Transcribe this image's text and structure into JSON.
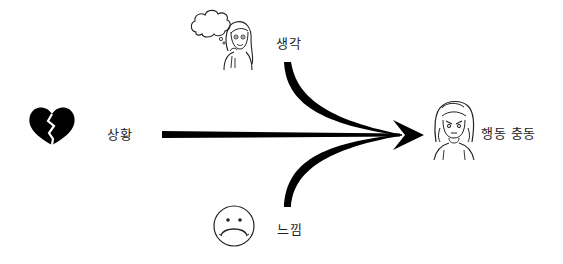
{
  "diagram": {
    "nodes": [
      {
        "id": "situation",
        "label": "상황",
        "icon": "broken-heart-icon"
      },
      {
        "id": "thought",
        "label": "생각",
        "icon": "thinking-woman-icon"
      },
      {
        "id": "feeling",
        "label": "느낌",
        "icon": "sad-face-icon"
      },
      {
        "id": "action_urge",
        "label": "행동 충동",
        "icon": "upset-woman-icon"
      }
    ],
    "edges": [
      {
        "from": "situation",
        "to": "action_urge",
        "style": "straight-tapered"
      },
      {
        "from": "thought",
        "to": "action_urge",
        "style": "curved-tapered"
      },
      {
        "from": "feeling",
        "to": "action_urge",
        "style": "curved-tapered"
      }
    ],
    "colors": {
      "ink": "#000000",
      "text": "#222222",
      "background": "#ffffff"
    }
  }
}
